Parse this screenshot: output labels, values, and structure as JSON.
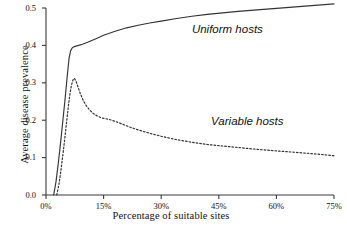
{
  "chart_data": {
    "type": "line",
    "title": "",
    "xlabel": "Percentage of suitable sites",
    "ylabel": "Average disease prevalence",
    "xlim": [
      0,
      75
    ],
    "ylim": [
      0.0,
      0.5
    ],
    "grid": false,
    "legend_position": "inline-annotations",
    "xticks": [
      0,
      15,
      30,
      45,
      60,
      75
    ],
    "xtick_labels": [
      "0%",
      "15%",
      "30%",
      "45%",
      "60%",
      "75%"
    ],
    "yticks": [
      0.0,
      0.1,
      0.2,
      0.3,
      0.4,
      0.5
    ],
    "ytick_labels": [
      "0.0",
      "0.1",
      "0.2",
      "0.3",
      "0.4",
      "0.5"
    ],
    "series": [
      {
        "name": "Uniform hosts",
        "style": "solid",
        "color": "#333333",
        "annotation": "Uniform hosts",
        "x": [
          2.0,
          2.6,
          3.2,
          3.8,
          4.4,
          5.0,
          5.6,
          6.0,
          6.4,
          6.8,
          7.2,
          7.8,
          8.5,
          9.5,
          11.0,
          13.0,
          15.0,
          18.0,
          21.0,
          24.0,
          27.0,
          30.0,
          34.0,
          38.0,
          42.0,
          46.0,
          50.0,
          55.0,
          60.0,
          65.0,
          70.0,
          75.0
        ],
        "y": [
          0.0,
          0.035,
          0.085,
          0.14,
          0.2,
          0.26,
          0.325,
          0.365,
          0.385,
          0.393,
          0.396,
          0.398,
          0.4,
          0.403,
          0.409,
          0.418,
          0.427,
          0.438,
          0.447,
          0.454,
          0.46,
          0.465,
          0.472,
          0.478,
          0.483,
          0.487,
          0.491,
          0.495,
          0.499,
          0.503,
          0.507,
          0.511
        ]
      },
      {
        "name": "Variable hosts",
        "style": "dashed",
        "color": "#333333",
        "annotation": "Variable hosts",
        "x": [
          2.8,
          3.4,
          4.0,
          4.6,
          5.2,
          5.8,
          6.2,
          6.6,
          7.0,
          7.4,
          7.8,
          8.3,
          8.9,
          9.6,
          10.4,
          11.3,
          12.3,
          13.4,
          14.5,
          15.5,
          16.5,
          18.0,
          20.0,
          22.0,
          24.0,
          27.0,
          30.0,
          34.0,
          38.0,
          42.0,
          46.0,
          50.0,
          55.0,
          60.0,
          65.0,
          70.0,
          75.0
        ],
        "y": [
          0.0,
          0.03,
          0.075,
          0.125,
          0.18,
          0.235,
          0.268,
          0.292,
          0.307,
          0.312,
          0.305,
          0.29,
          0.272,
          0.255,
          0.24,
          0.228,
          0.218,
          0.211,
          0.206,
          0.204,
          0.202,
          0.197,
          0.189,
          0.181,
          0.174,
          0.165,
          0.157,
          0.148,
          0.141,
          0.135,
          0.131,
          0.127,
          0.122,
          0.118,
          0.114,
          0.11,
          0.105
        ]
      }
    ],
    "annotations": [
      {
        "text": "Uniform hosts",
        "x_pct": 38,
        "y_value": 0.44
      },
      {
        "text": "Variable hosts",
        "x_pct": 43,
        "y_value": 0.195
      }
    ],
    "axis_color": "#3a3a3a"
  }
}
